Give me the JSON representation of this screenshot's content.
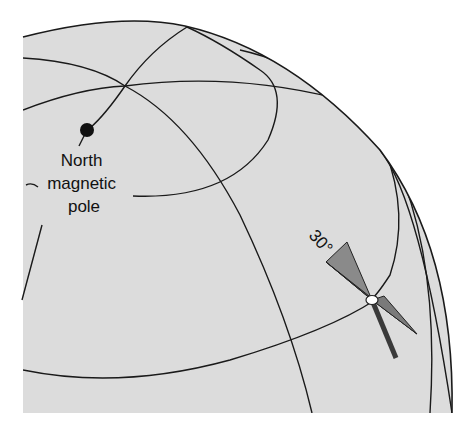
{
  "figure": {
    "pole_label_lines": [
      "North",
      "magnetic",
      "pole"
    ],
    "angle_label": "30°",
    "colors": {
      "sphere_fill": "#dcdcdc",
      "line": "#1a1a1a",
      "wedge_light": "#8a8a8a",
      "wedge_dark": "#4a4a4a",
      "needle": "#3a3a3a",
      "pivot": "#ffffff"
    }
  }
}
